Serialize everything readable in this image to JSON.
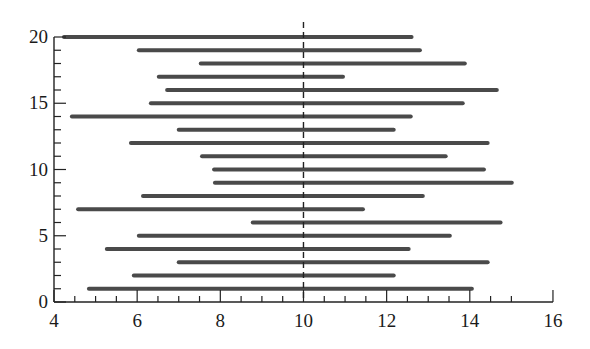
{
  "chart_data": {
    "type": "interval",
    "title": "",
    "xlabel": "",
    "ylabel": "",
    "xlim": [
      4,
      16
    ],
    "ylim": [
      0,
      20
    ],
    "x_ticks": [
      4,
      6,
      8,
      10,
      12,
      14,
      16
    ],
    "x_minor_step": 0.5,
    "y_ticks": [
      0,
      5,
      10,
      15,
      20
    ],
    "y_minor_step": 1,
    "grid": false,
    "legend": null,
    "reference_line": {
      "x": 10,
      "style": "dashed",
      "color": "#222222"
    },
    "bar_color": "#4a4a4a",
    "intervals": [
      {
        "y": 1,
        "low": 4.84,
        "high": 14.05
      },
      {
        "y": 2,
        "low": 5.92,
        "high": 12.17
      },
      {
        "y": 3,
        "low": 7.0,
        "high": 14.43
      },
      {
        "y": 4,
        "low": 5.27,
        "high": 12.53
      },
      {
        "y": 5,
        "low": 6.04,
        "high": 13.52
      },
      {
        "y": 6,
        "low": 8.78,
        "high": 14.74
      },
      {
        "y": 7,
        "low": 4.58,
        "high": 11.43
      },
      {
        "y": 8,
        "low": 6.14,
        "high": 12.87
      },
      {
        "y": 9,
        "low": 7.87,
        "high": 15.01
      },
      {
        "y": 10,
        "low": 7.85,
        "high": 14.34
      },
      {
        "y": 11,
        "low": 7.56,
        "high": 13.42
      },
      {
        "y": 12,
        "low": 5.85,
        "high": 14.43
      },
      {
        "y": 13,
        "low": 7.0,
        "high": 12.17
      },
      {
        "y": 14,
        "low": 4.43,
        "high": 12.58
      },
      {
        "y": 15,
        "low": 6.33,
        "high": 13.83
      },
      {
        "y": 16,
        "low": 6.72,
        "high": 14.65
      },
      {
        "y": 17,
        "low": 6.52,
        "high": 10.95
      },
      {
        "y": 18,
        "low": 7.53,
        "high": 13.88
      },
      {
        "y": 19,
        "low": 6.04,
        "high": 12.8
      },
      {
        "y": 20,
        "low": 4.24,
        "high": 12.6
      }
    ]
  }
}
